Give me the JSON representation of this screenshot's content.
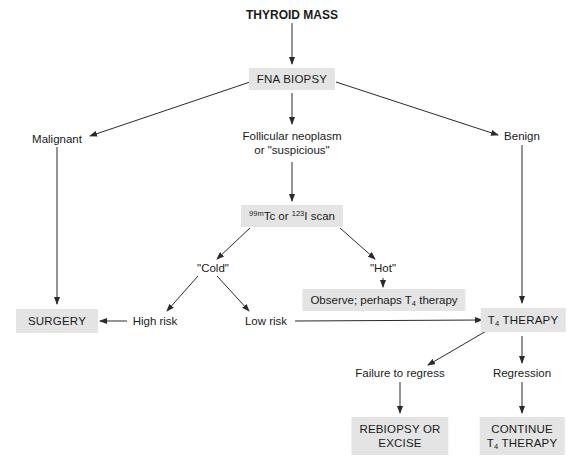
{
  "diagram": {
    "title": "THYROID MASS",
    "nodes": {
      "fna_biopsy": "FNA BIOPSY",
      "malignant": "Malignant",
      "follicular_line1": "Follicular neoplasm",
      "follicular_line2": "or \"suspicious\"",
      "benign": "Benign",
      "scan": {
        "iso1_sup": "99m",
        "iso1": "Tc or ",
        "iso2_sup": "123",
        "iso2": "I scan"
      },
      "cold": "\"Cold\"",
      "hot": "\"Hot\"",
      "observe": {
        "pre": "Observe; perhaps T",
        "sub": "4",
        "post": " therapy"
      },
      "surgery": "SURGERY",
      "high_risk": "High risk",
      "low_risk": "Low risk",
      "t4_therapy": {
        "pre": "T",
        "sub": "4",
        "post": " THERAPY"
      },
      "failure_to_regress": "Failure to regress",
      "regression": "Regression",
      "rebiopsy_line1": "REBIOPSY OR",
      "rebiopsy_line2": "EXCISE",
      "continue_line1": "CONTINUE",
      "continue_t4": {
        "pre": "T",
        "sub": "4",
        "post": " THERAPY"
      }
    },
    "edges": [
      {
        "from": "THYROID MASS",
        "to": "FNA BIOPSY"
      },
      {
        "from": "FNA BIOPSY",
        "to": "Malignant"
      },
      {
        "from": "FNA BIOPSY",
        "to": "Follicular neoplasm or \"suspicious\""
      },
      {
        "from": "FNA BIOPSY",
        "to": "Benign"
      },
      {
        "from": "Malignant",
        "to": "SURGERY"
      },
      {
        "from": "Follicular neoplasm or \"suspicious\"",
        "to": "99mTc or 123I scan"
      },
      {
        "from": "99mTc or 123I scan",
        "to": "\"Cold\""
      },
      {
        "from": "99mTc or 123I scan",
        "to": "\"Hot\""
      },
      {
        "from": "\"Hot\"",
        "to": "Observe; perhaps T4 therapy"
      },
      {
        "from": "\"Cold\"",
        "to": "High risk"
      },
      {
        "from": "\"Cold\"",
        "to": "Low risk"
      },
      {
        "from": "High risk",
        "to": "SURGERY"
      },
      {
        "from": "Low risk",
        "to": "T4 THERAPY"
      },
      {
        "from": "Benign",
        "to": "T4 THERAPY"
      },
      {
        "from": "T4 THERAPY",
        "to": "Failure to regress"
      },
      {
        "from": "T4 THERAPY",
        "to": "Regression"
      },
      {
        "from": "Failure to regress",
        "to": "REBIOPSY OR EXCISE"
      },
      {
        "from": "Regression",
        "to": "CONTINUE T4 THERAPY"
      }
    ],
    "colors": {
      "box_fill": "#e4e4e4",
      "line": "#2a2a2a",
      "text": "#1a1a1a"
    }
  }
}
